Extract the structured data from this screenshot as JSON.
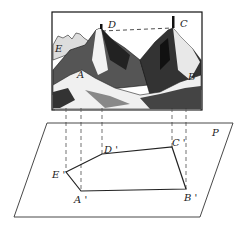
{
  "figure": {
    "picture_labels": {
      "D": "D",
      "C": "C",
      "E": "E",
      "A": "A",
      "B": "B"
    },
    "plane_label": "P",
    "projection_labels": {
      "E": "E '",
      "D": "D '",
      "C": "C '",
      "A": "A '",
      "B": "B '"
    },
    "colors": {
      "line": "#222222",
      "ink": "#111111",
      "background": "#ffffff"
    }
  }
}
